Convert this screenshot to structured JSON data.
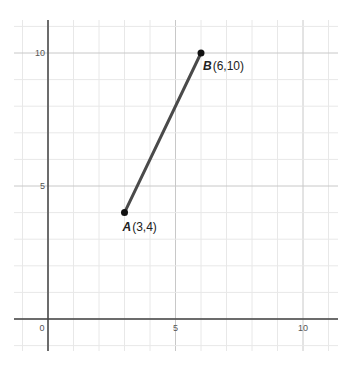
{
  "chart_data": {
    "type": "line",
    "title": "",
    "xlabel": "",
    "ylabel": "",
    "xlim": [
      -1.3,
      11.4
    ],
    "ylim": [
      -1.2,
      11.2
    ],
    "grid": true,
    "x_ticks": [
      "0",
      "5",
      "10"
    ],
    "y_ticks": [
      "5",
      "10"
    ],
    "points": [
      {
        "name": "A",
        "label": "(3,4)",
        "x": 3,
        "y": 4
      },
      {
        "name": "B",
        "label": "(6,10)",
        "x": 6,
        "y": 10
      }
    ],
    "series": [
      {
        "name": "segment AB",
        "x": [
          3,
          6
        ],
        "y": [
          4,
          10
        ]
      }
    ]
  },
  "colors": {
    "segment": "#4a4a4a",
    "point": "#111111",
    "axis": "#444444",
    "major_grid": "#c8c8c8",
    "minor_grid": "#e8e8e8"
  }
}
